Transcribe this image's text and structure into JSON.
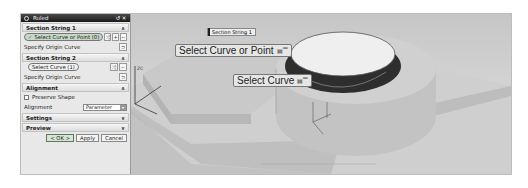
{
  "dialog": {
    "title": "Ruled",
    "title_buttons": [
      "reset",
      "close"
    ],
    "sections": [
      {
        "header": "Section String 1",
        "expanded": true,
        "select_label": "Select Curve or Point (0)",
        "select_active": true,
        "origin_label": "Specify Origin Curve"
      },
      {
        "header": "Section String 2",
        "expanded": true,
        "select_label": "Select Curve (1)",
        "select_active": false,
        "origin_label": "Specify Origin Curve"
      }
    ],
    "alignment": {
      "header": "Alignment",
      "preserve_shape_label": "Preserve Shape",
      "preserve_shape_checked": false,
      "alignment_label": "Alignment",
      "alignment_value": "Parameter"
    },
    "settings_header": "Settings",
    "preview_header": "Preview",
    "buttons": {
      "ok": "< OK >",
      "apply": "Apply",
      "cancel": "Cancel"
    }
  },
  "viewport": {
    "tag_label": "Section String 1",
    "callout_1": "Select Curve or Point",
    "callout_2": "Select Curve",
    "callout_icon": "filter-icon",
    "axis_label": "ZC"
  },
  "colors": {
    "dialog_bg": "#e8e8e8",
    "titlebar": "#1a1a1a",
    "viewport_bg": "#cccccc",
    "model_face": "#bcbcbc",
    "cup_dark": "#3a3a3a"
  }
}
